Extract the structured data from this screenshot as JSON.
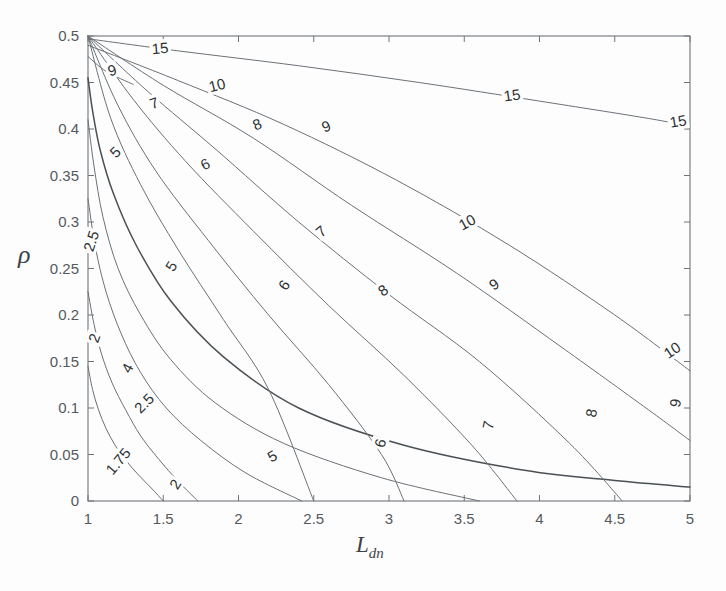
{
  "figure": {
    "type": "contour-plot",
    "background_color": "#fdfdfd",
    "line_color": "#6b7176",
    "axis_color": "#6f7479",
    "text_color": "#555a5e"
  },
  "axes": {
    "x": {
      "title_main": "L",
      "title_sub": "dn",
      "min": 1,
      "max": 5,
      "ticks": [
        1,
        1.5,
        2,
        2.5,
        3,
        3.5,
        4,
        4.5,
        5
      ],
      "tick_labels": [
        "1",
        "1.5",
        "2",
        "2.5",
        "3",
        "3.5",
        "4",
        "4.5",
        "5"
      ]
    },
    "y": {
      "title": "ρ",
      "min": 0,
      "max": 0.5,
      "ticks": [
        0,
        0.05,
        0.1,
        0.15,
        0.2,
        0.25,
        0.3,
        0.35,
        0.4,
        0.45,
        0.5
      ],
      "tick_labels": [
        "0",
        "0.05",
        "0.1",
        "0.15",
        "0.2",
        "0.25",
        "0.3",
        "0.35",
        "0.4",
        "0.45",
        "0.5"
      ]
    }
  },
  "chart_data": {
    "type": "line",
    "title": "",
    "xlabel": "L_dn",
    "ylabel": "rho",
    "xlim": [
      1,
      5
    ],
    "ylim": [
      0,
      0.5
    ],
    "grid": false,
    "legend": "none",
    "contour_levels": [
      1.75,
      2,
      2.5,
      4,
      5,
      6,
      7,
      8,
      9,
      10,
      15
    ],
    "series": [
      {
        "name": "1.75",
        "level": 1.75,
        "emphasis": "normal",
        "x": [
          1.0,
          1.03,
          1.07,
          1.12,
          1.18,
          1.25,
          1.33,
          1.42,
          1.5
        ],
        "y": [
          0.145,
          0.12,
          0.098,
          0.078,
          0.06,
          0.044,
          0.029,
          0.014,
          0.0
        ]
      },
      {
        "name": "2",
        "level": 2,
        "emphasis": "normal",
        "x": [
          1.0,
          1.04,
          1.09,
          1.16,
          1.25,
          1.35,
          1.47,
          1.6,
          1.73
        ],
        "y": [
          0.225,
          0.19,
          0.158,
          0.127,
          0.098,
          0.07,
          0.045,
          0.021,
          0.0
        ]
      },
      {
        "name": "2.5",
        "level": 2.5,
        "emphasis": "normal",
        "x": [
          1.0,
          1.05,
          1.12,
          1.22,
          1.35,
          1.52,
          1.75,
          2.05,
          2.42
        ],
        "y": [
          0.325,
          0.272,
          0.225,
          0.18,
          0.138,
          0.1,
          0.065,
          0.03,
          0.0
        ]
      },
      {
        "name": "4",
        "level": 4,
        "emphasis": "normal",
        "x": [
          1.0,
          1.04,
          1.1,
          1.2,
          1.35,
          1.55,
          1.85,
          2.3,
          2.95,
          3.6
        ],
        "y": [
          0.41,
          0.36,
          0.305,
          0.25,
          0.2,
          0.152,
          0.105,
          0.062,
          0.025,
          0.0
        ]
      },
      {
        "name": "5",
        "level": 5,
        "emphasis": "bold",
        "x": [
          1.0,
          1.03,
          1.08,
          1.17,
          1.32,
          1.55,
          1.9,
          2.4,
          3.1,
          3.9,
          4.5,
          5.0
        ],
        "y": [
          0.455,
          0.42,
          0.378,
          0.33,
          0.275,
          0.215,
          0.155,
          0.1,
          0.06,
          0.033,
          0.022,
          0.015
        ]
      },
      {
        "name": "5-upper",
        "level": 5,
        "emphasis": "normal",
        "x": [
          1.0,
          1.15,
          1.35,
          1.6,
          1.9,
          2.2,
          2.5
        ],
        "y": [
          0.5,
          0.412,
          0.34,
          0.27,
          0.195,
          0.12,
          0.0
        ]
      },
      {
        "name": "6",
        "level": 6,
        "emphasis": "normal",
        "x": [
          1.0,
          1.2,
          1.45,
          1.8,
          2.2,
          2.6,
          2.95,
          3.1
        ],
        "y": [
          0.5,
          0.425,
          0.355,
          0.28,
          0.2,
          0.125,
          0.05,
          0.0
        ]
      },
      {
        "name": "7",
        "level": 7,
        "emphasis": "normal",
        "x": [
          1.0,
          1.3,
          1.65,
          2.1,
          2.6,
          3.1,
          3.55,
          3.85
        ],
        "y": [
          0.5,
          0.432,
          0.365,
          0.29,
          0.21,
          0.135,
          0.06,
          0.0
        ]
      },
      {
        "name": "8",
        "level": 8,
        "emphasis": "normal",
        "x": [
          1.0,
          1.4,
          1.85,
          2.4,
          3.0,
          3.6,
          4.2,
          4.55
        ],
        "y": [
          0.5,
          0.44,
          0.378,
          0.3,
          0.222,
          0.15,
          0.062,
          0.0
        ]
      },
      {
        "name": "9",
        "level": 9,
        "emphasis": "normal",
        "x": [
          1.0,
          1.5,
          2.1,
          2.75,
          3.45,
          4.15,
          4.75,
          5.0
        ],
        "y": [
          0.5,
          0.447,
          0.39,
          0.318,
          0.245,
          0.165,
          0.095,
          0.065
        ]
      },
      {
        "name": "9-low",
        "level": 9,
        "emphasis": "normal",
        "x": [
          1.0,
          1.12,
          1.3
        ],
        "y": [
          0.478,
          0.462,
          0.448
        ]
      },
      {
        "name": "10",
        "level": 10,
        "emphasis": "normal",
        "x": [
          1.0,
          1.6,
          2.3,
          3.05,
          3.8,
          4.5,
          5.0
        ],
        "y": [
          0.49,
          0.452,
          0.405,
          0.345,
          0.275,
          0.2,
          0.14
        ]
      },
      {
        "name": "15",
        "level": 15,
        "emphasis": "normal",
        "x": [
          1.0,
          1.6,
          2.4,
          3.2,
          4.0,
          4.7,
          5.0
        ],
        "y": [
          0.497,
          0.484,
          0.468,
          0.45,
          0.43,
          0.412,
          0.403
        ]
      }
    ],
    "contour_labels": [
      {
        "text": "15",
        "x": 1.48,
        "y": 0.487,
        "rotation": -5
      },
      {
        "text": "15",
        "x": 3.82,
        "y": 0.437,
        "rotation": -8
      },
      {
        "text": "15",
        "x": 4.92,
        "y": 0.409,
        "rotation": -10
      },
      {
        "text": "9",
        "x": 1.16,
        "y": 0.463,
        "rotation": -18
      },
      {
        "text": "10",
        "x": 1.86,
        "y": 0.447,
        "rotation": -14
      },
      {
        "text": "10",
        "x": 3.52,
        "y": 0.3,
        "rotation": -28
      },
      {
        "text": "10",
        "x": 4.88,
        "y": 0.162,
        "rotation": -34
      },
      {
        "text": "7",
        "x": 1.44,
        "y": 0.428,
        "rotation": -20
      },
      {
        "text": "8",
        "x": 2.12,
        "y": 0.405,
        "rotation": -22
      },
      {
        "text": "9",
        "x": 2.58,
        "y": 0.403,
        "rotation": -22
      },
      {
        "text": "8",
        "x": 2.96,
        "y": 0.227,
        "rotation": -36
      },
      {
        "text": "9",
        "x": 3.7,
        "y": 0.233,
        "rotation": -34
      },
      {
        "text": "5",
        "x": 1.18,
        "y": 0.375,
        "rotation": -45
      },
      {
        "text": "6",
        "x": 1.78,
        "y": 0.362,
        "rotation": -28
      },
      {
        "text": "7",
        "x": 2.55,
        "y": 0.29,
        "rotation": -40
      },
      {
        "text": "6",
        "x": 2.3,
        "y": 0.232,
        "rotation": -55
      },
      {
        "text": "5",
        "x": 1.55,
        "y": 0.253,
        "rotation": -58
      },
      {
        "text": "2.5",
        "x": 1.02,
        "y": 0.28,
        "rotation": -72
      },
      {
        "text": "2",
        "x": 1.04,
        "y": 0.175,
        "rotation": -70
      },
      {
        "text": "4",
        "x": 1.26,
        "y": 0.143,
        "rotation": -62
      },
      {
        "text": "2.5",
        "x": 1.37,
        "y": 0.105,
        "rotation": -45
      },
      {
        "text": "1.75",
        "x": 1.2,
        "y": 0.043,
        "rotation": -50
      },
      {
        "text": "2",
        "x": 1.58,
        "y": 0.018,
        "rotation": -58
      },
      {
        "text": "5",
        "x": 2.22,
        "y": 0.048,
        "rotation": -30
      },
      {
        "text": "6",
        "x": 2.94,
        "y": 0.062,
        "rotation": -75
      },
      {
        "text": "7",
        "x": 3.66,
        "y": 0.082,
        "rotation": -78
      },
      {
        "text": "8",
        "x": 4.34,
        "y": 0.095,
        "rotation": -80
      },
      {
        "text": "9",
        "x": 4.9,
        "y": 0.105,
        "rotation": -80
      }
    ]
  }
}
